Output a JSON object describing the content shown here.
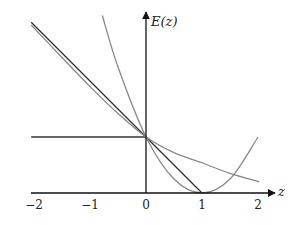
{
  "chart_data": {
    "type": "line",
    "title": "",
    "xlabel": "z",
    "ylabel": "E(z)",
    "xlim": [
      -2.1,
      2.3
    ],
    "ylim": [
      0,
      3.2
    ],
    "grid": false,
    "x_ticks": [
      -2,
      -1,
      0,
      1,
      2
    ],
    "x_tick_labels": [
      "−2",
      "−1",
      "0",
      "1",
      "2"
    ],
    "series": [
      {
        "name": "horizontal-line",
        "color": "#333333",
        "points": [
          [
            -2.05,
            1
          ],
          [
            0,
            1
          ]
        ]
      },
      {
        "name": "tangent-line",
        "description": "E = 1 - z",
        "color": "#333333",
        "points": [
          [
            -2.05,
            3.05
          ],
          [
            1,
            0
          ]
        ]
      },
      {
        "name": "convex-curve",
        "color": "#888888",
        "points": [
          [
            -2.05,
            3.0
          ],
          [
            -1.5,
            2.42
          ],
          [
            -1,
            1.9
          ],
          [
            -0.5,
            1.42
          ],
          [
            0,
            1
          ],
          [
            0.5,
            0.72
          ],
          [
            1,
            0.54
          ],
          [
            1.5,
            0.35
          ],
          [
            2.02,
            0.2
          ]
        ]
      },
      {
        "name": "parabola",
        "description": "E = (1 - z)^2",
        "color": "#888888",
        "points": [
          [
            -0.78,
            3.17
          ],
          [
            -0.5,
            2.25
          ],
          [
            0,
            1
          ],
          [
            0.5,
            0.25
          ],
          [
            1,
            0
          ],
          [
            1.5,
            0.25
          ],
          [
            2,
            1
          ]
        ]
      }
    ]
  },
  "axes": {
    "x_label": "z",
    "y_label": "E(z)"
  }
}
